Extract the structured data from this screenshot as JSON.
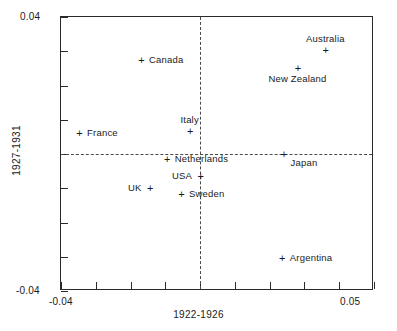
{
  "chart_data": {
    "type": "scatter",
    "title": "",
    "xlabel": "1922-1926",
    "ylabel": "1927-1931",
    "xlim": [
      -0.04,
      0.05
    ],
    "ylim": [
      -0.04,
      0.04
    ],
    "xticks": [
      -0.04,
      -0.03,
      -0.02,
      -0.01,
      0.0,
      0.01,
      0.02,
      0.03,
      0.04,
      0.05
    ],
    "yticks": [
      -0.04,
      -0.03,
      -0.02,
      -0.01,
      0.0,
      0.01,
      0.02,
      0.03,
      0.04
    ],
    "xtick_labels_shown": [
      "-0.04",
      "0.05"
    ],
    "ytick_labels_shown": [
      "0.04",
      "-0.04"
    ],
    "grid": false,
    "legend": false,
    "reference_lines": [
      {
        "orientation": "vertical",
        "value": 0.0,
        "style": "dashed"
      },
      {
        "orientation": "horizontal",
        "value": 0.0,
        "style": "dashed"
      }
    ],
    "marker": "+",
    "points": [
      {
        "label": "Australia",
        "x": 0.036,
        "y": 0.0305,
        "label_pos": "above"
      },
      {
        "label": "New Zealand",
        "x": 0.028,
        "y": 0.025,
        "label_pos": "below"
      },
      {
        "label": "Canada",
        "x": -0.017,
        "y": 0.0275,
        "label_pos": "right"
      },
      {
        "label": "Italy",
        "x": -0.003,
        "y": 0.0068,
        "label_pos": "above"
      },
      {
        "label": "France",
        "x": -0.0348,
        "y": 0.006,
        "label_pos": "right"
      },
      {
        "label": "Netherlands",
        "x": -0.0096,
        "y": -0.0014,
        "label_pos": "right"
      },
      {
        "label": "Japan",
        "x": 0.024,
        "y": 0.0001,
        "label_pos": "below-right"
      },
      {
        "label": "USA",
        "x": 0.0,
        "y": -0.0065,
        "label_pos": "left"
      },
      {
        "label": "UK",
        "x": -0.0145,
        "y": -0.0098,
        "label_pos": "left"
      },
      {
        "label": "Sweden",
        "x": -0.0055,
        "y": -0.0118,
        "label_pos": "right"
      },
      {
        "label": "Argentina",
        "x": 0.0235,
        "y": -0.0305,
        "label_pos": "right"
      }
    ]
  },
  "axes": {
    "x_min_label": "-0.04",
    "x_max_label": "0.05",
    "y_min_label": "-0.04",
    "y_max_label": "0.04",
    "x_title": "1922-1926",
    "y_title": "1927-1931"
  }
}
